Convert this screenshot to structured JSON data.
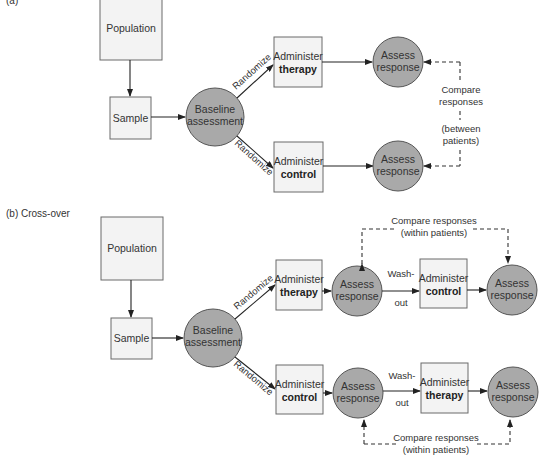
{
  "panels": {
    "a": {
      "label": "(a)",
      "population": "Population",
      "sample": "Sample",
      "baseline": [
        "Baseline",
        "assessment"
      ],
      "randomize_upper": "Randomize",
      "randomize_lower": "Randomize",
      "arm1": {
        "line1": "Administer",
        "line2": "therapy"
      },
      "arm2": {
        "line1": "Administer",
        "line2": "control"
      },
      "assess": [
        "Assess",
        "response"
      ],
      "compare": [
        "Compare",
        "responses",
        "(between",
        "patients)"
      ]
    },
    "b": {
      "label": "(b) Cross-over",
      "population": "Population",
      "sample": "Sample",
      "baseline": [
        "Baseline",
        "assessment"
      ],
      "randomize_upper": "Randomize",
      "randomize_lower": "Randomize",
      "upper_first": {
        "line1": "Administer",
        "line2": "therapy"
      },
      "upper_second": {
        "line1": "Administer",
        "line2": "control"
      },
      "lower_first": {
        "line1": "Administer",
        "line2": "control"
      },
      "lower_second": {
        "line1": "Administer",
        "line2": "therapy"
      },
      "assess": [
        "Assess",
        "response"
      ],
      "washout": [
        "Wash-",
        "out"
      ],
      "compare": [
        "Compare responses",
        "(within patients)"
      ]
    }
  },
  "colors": {
    "box_fill": "#f3f3f3",
    "circle_fill": "#a9a9a9",
    "line": "#222222"
  }
}
